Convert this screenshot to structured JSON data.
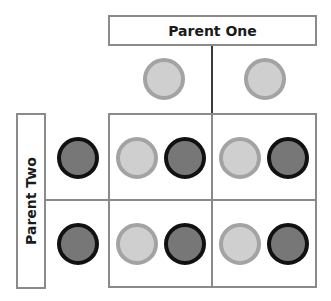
{
  "diagram": {
    "type": "punnett-square",
    "parent_one": {
      "label": "Parent One",
      "alleles": [
        {
          "shade": "light"
        },
        {
          "shade": "light"
        }
      ]
    },
    "parent_two": {
      "label": "Parent Two",
      "alleles": [
        {
          "shade": "dark"
        },
        {
          "shade": "dark"
        }
      ]
    },
    "cells": [
      [
        [
          "light",
          "dark"
        ],
        [
          "light",
          "dark"
        ]
      ],
      [
        [
          "light",
          "dark"
        ],
        [
          "light",
          "dark"
        ]
      ]
    ],
    "colors": {
      "light_fill": "#cfcfcf",
      "light_border": "#a3a3a3",
      "dark_fill": "#777777",
      "dark_border": "#111111",
      "box_border": "#8a8a8a"
    }
  }
}
